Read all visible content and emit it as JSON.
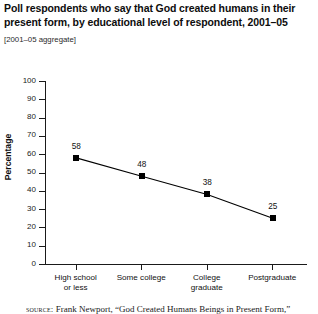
{
  "header": {
    "title_line1": "Poll respondents who say that God created humans in their",
    "title_line2": "present form, by educational level of respondent, 2001–05",
    "subtitle": "[2001–05 aggregate]"
  },
  "source": {
    "label": "source:",
    "text": "Frank Newport, “God Created Humans Beings in Present Form,”"
  },
  "chart_data": {
    "type": "line",
    "title": "Poll respondents who say that God created humans in their present form, by educational level of respondent, 2001–05",
    "subtitle": "[2001–05 aggregate]",
    "xlabel": "",
    "ylabel": "Percentage",
    "ylim": [
      0,
      100
    ],
    "grid": false,
    "legend": "none",
    "marker": "square",
    "line_color": "#000000",
    "marker_color": "#000000",
    "categories": [
      "High school or less",
      "Some college",
      "College graduate",
      "Postgraduate"
    ],
    "category_lines": [
      [
        "High school",
        "or less"
      ],
      [
        "Some college"
      ],
      [
        "College",
        "graduate"
      ],
      [
        "Postgraduate"
      ]
    ],
    "values": [
      58,
      48,
      38,
      25
    ],
    "value_labels": [
      "58",
      "48",
      "38",
      "25"
    ],
    "yticks": [
      0,
      10,
      20,
      30,
      40,
      50,
      60,
      70,
      80,
      90,
      100
    ],
    "ytick_labels": [
      "0",
      "10",
      "20",
      "30",
      "40",
      "50",
      "60",
      "70",
      "80",
      "90",
      "100"
    ]
  }
}
